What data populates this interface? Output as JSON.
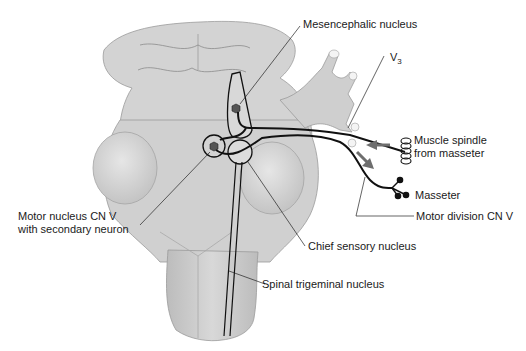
{
  "diagram": {
    "colors": {
      "brainstem_fill": "#d4d4d4",
      "brainstem_shade": "#bdbdbd",
      "outline": "#8a8a8a",
      "pathway": "#111111",
      "arrow": "#6e6e6e",
      "neuron_body": "#555555"
    },
    "labels": {
      "mesencephalic": "Mesencephalic nucleus",
      "v3_main": "V",
      "v3_sub": "3",
      "muscle_spindle_line1": "Muscle spindle",
      "muscle_spindle_line2": "from masseter",
      "masseter": "Masseter",
      "motor_division": "Motor division CN V",
      "motor_nucleus_line1": "Motor nucleus CN V",
      "motor_nucleus_line2": "with secondary neuron",
      "chief_sensory": "Chief sensory nucleus",
      "spinal_trigeminal": "Spinal trigeminal nucleus"
    },
    "arrows": [
      {
        "name": "afferent-arrow",
        "direction": "left",
        "meaning": "sensory input from muscle spindle"
      },
      {
        "name": "efferent-arrow",
        "direction": "down-right",
        "meaning": "motor output to masseter"
      }
    ]
  }
}
